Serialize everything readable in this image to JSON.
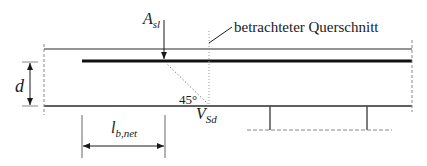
{
  "diagram": {
    "labels": {
      "asl_main": "A",
      "asl_sub": "sl",
      "section": "betrachteter Querschnitt",
      "d": "d",
      "angle": "45°",
      "vsd_main": "V",
      "vsd_sub": "Sd",
      "lb_main": "l",
      "lb_sub": "b,net"
    },
    "colors": {
      "line": "#2b2b2b",
      "rebar": "#111111",
      "dashed": "#888888"
    }
  }
}
